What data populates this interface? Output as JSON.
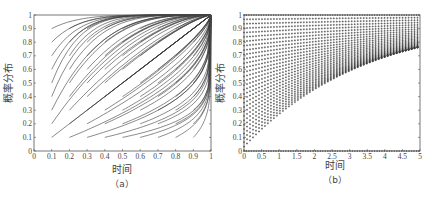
{
  "chart_data": [
    {
      "id": "a",
      "type": "line",
      "caption": "（a）",
      "xlabel": "时间",
      "ylabel": "概率分布",
      "xlim": [
        0,
        1
      ],
      "ylim": [
        0,
        1
      ],
      "xticks": [
        "0",
        "0.1",
        "0.2",
        "0.3",
        "0.4",
        "0.5",
        "0.6",
        "0.7",
        "0.8",
        "0.9",
        "1"
      ],
      "yticks": [
        "0",
        "0.1",
        "0.2",
        "0.3",
        "0.4",
        "0.5",
        "0.6",
        "0.7",
        "0.8",
        "0.9",
        "1"
      ],
      "grid": false,
      "description": "Family of curves starting from grid points (x0,y0) with x0,y0 in {0.1..0.9} and converging to x=1 / y=1",
      "start_x": [
        0.1,
        0.2,
        0.3,
        0.4,
        0.5,
        0.6,
        0.7,
        0.8,
        0.9
      ],
      "start_y": [
        0.1,
        0.2,
        0.3,
        0.4,
        0.5,
        0.6,
        0.7,
        0.8,
        0.9
      ],
      "line_color": "#3a3a3a"
    },
    {
      "id": "b",
      "type": "scatter",
      "caption": "（b）",
      "xlabel": "时间",
      "ylabel": "概率分布",
      "xlim": [
        0,
        5
      ],
      "ylim": [
        0,
        1
      ],
      "xticks": [
        "0",
        "0.5",
        "1",
        "1.5",
        "2",
        "2.5",
        "3",
        "3.5",
        "4",
        "4.5",
        "5"
      ],
      "yticks": [
        "0",
        "0.1",
        "0.2",
        "0.3",
        "0.4",
        "0.5",
        "0.6",
        "0.7",
        "0.8",
        "0.9",
        "1"
      ],
      "grid": false,
      "description": "Dense '+' markers along curves rising from initial values y0 in {0.1..0.9} at t=0, approaching 1; a dense band at y=0 and y=1",
      "start_y": [
        0.1,
        0.2,
        0.3,
        0.4,
        0.5,
        0.6,
        0.7,
        0.8,
        0.9
      ],
      "marker_color": "#3a3a3a"
    }
  ]
}
